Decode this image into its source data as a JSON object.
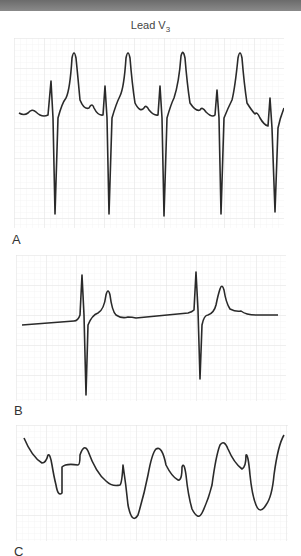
{
  "figure": {
    "title_main": "Lead V",
    "title_sub": "3",
    "grid_color": "#e6e6e6",
    "trace_color": "#2a2a2a"
  },
  "panels": [
    {
      "label": "A",
      "description": "Lead V3 strip with four regular complexes: tall narrow positive spike followed by deep negative deflection, then tall peaked T wave"
    },
    {
      "label": "B",
      "description": "Lead V3 strip with two complexes: narrow positive spike, deep negative deflection, peaked T wave; flat baseline between"
    },
    {
      "label": "C",
      "description": "Lead V3 strip with wide, bizarre undulating complexes (sine-wave-like pattern)"
    }
  ]
}
